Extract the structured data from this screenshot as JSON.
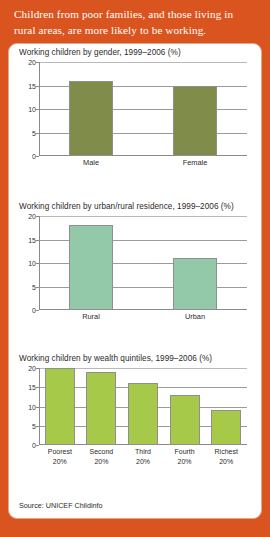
{
  "header": {
    "text": "Children from poor families, and those living in rural areas, are more likely to be working."
  },
  "source": {
    "label": "Source: UNICEF Childinfo"
  },
  "colors": {
    "banner_orange": "#d9541e",
    "card_background": "#ffffff",
    "bar_olive": "#7f8c4a",
    "bar_mint": "#93c8a8",
    "bar_lime": "#a6c94a",
    "grid_gray": "#9a9a9a",
    "text_dark": "#2b2b2b"
  },
  "chart_data": [
    {
      "type": "bar",
      "title": "Working children by gender, 1999–2006 (%)",
      "categories": [
        "Male",
        "Female"
      ],
      "values": [
        16,
        15
      ],
      "xlabel": "",
      "ylabel": "",
      "ylim": [
        0,
        20
      ],
      "yticks": [
        0,
        5,
        10,
        15,
        20
      ],
      "grid": true,
      "legend": "none",
      "bar_color": "#7f8c4a"
    },
    {
      "type": "bar",
      "title": "Working children by urban/rural residence, 1999–2006 (%)",
      "categories": [
        "Rural",
        "Urban"
      ],
      "values": [
        18,
        11
      ],
      "xlabel": "",
      "ylabel": "",
      "ylim": [
        0,
        20
      ],
      "yticks": [
        0,
        5,
        10,
        15,
        20
      ],
      "grid": true,
      "legend": "none",
      "bar_color": "#93c8a8"
    },
    {
      "type": "bar",
      "title": "Working children by wealth quintiles, 1999–2006 (%)",
      "categories": [
        "Poorest\n20%",
        "Second\n20%",
        "Third\n20%",
        "Fourth\n20%",
        "Richest\n20%"
      ],
      "values": [
        20,
        19,
        16,
        13,
        9
      ],
      "xlabel": "",
      "ylabel": "",
      "ylim": [
        0,
        20
      ],
      "yticks": [
        0,
        5,
        10,
        15,
        20
      ],
      "grid": true,
      "legend": "none",
      "bar_color": "#a6c94a"
    }
  ]
}
